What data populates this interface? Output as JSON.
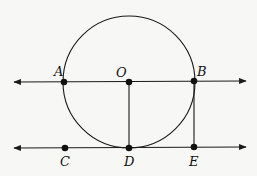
{
  "diagram": {
    "colors": {
      "stroke": "#1a1a1a",
      "background": "#f7f7f5"
    },
    "circle": {
      "center": "O",
      "cx": 129,
      "cy": 82,
      "r": 66
    },
    "lines": [
      {
        "name": "line-AB",
        "x1": 14,
        "y1": 82,
        "x2": 246,
        "y2": 81,
        "arrows": "both"
      },
      {
        "name": "line-CE",
        "x1": 14,
        "y1": 148,
        "x2": 246,
        "y2": 147,
        "arrows": "both"
      }
    ],
    "segments": [
      {
        "name": "segment-OD",
        "from": "O",
        "to": "D"
      },
      {
        "name": "segment-BE",
        "from": "B",
        "to": "E"
      }
    ],
    "points": [
      {
        "label": "A",
        "x": 64,
        "y": 82,
        "lx": 54,
        "ly": 76
      },
      {
        "label": "O",
        "x": 129,
        "y": 82,
        "lx": 116,
        "ly": 77
      },
      {
        "label": "B",
        "x": 194,
        "y": 81,
        "lx": 197,
        "ly": 76
      },
      {
        "label": "C",
        "x": 65,
        "y": 148,
        "lx": 60,
        "ly": 166
      },
      {
        "label": "D",
        "x": 129,
        "y": 148,
        "lx": 124,
        "ly": 166
      },
      {
        "label": "E",
        "x": 194,
        "y": 147,
        "lx": 189,
        "ly": 166
      }
    ]
  }
}
